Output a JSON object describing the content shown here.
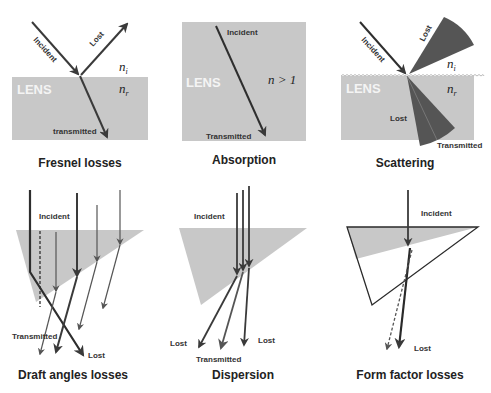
{
  "colors": {
    "lens_fill": "#c8c8c8",
    "ray": "#3a3a3a",
    "cone": "#555555",
    "background": "#ffffff"
  },
  "panels": [
    {
      "id": "fresnel",
      "caption": "Fresnel losses",
      "lens_label": "LENS",
      "labels": {
        "incident": "Incident",
        "lost": "Lost",
        "transmitted": "transmitted",
        "n_i": "n",
        "n_i_sub": "i",
        "n_r": "n",
        "n_r_sub": "r"
      }
    },
    {
      "id": "absorption",
      "caption": "Absorption",
      "lens_label": "LENS",
      "labels": {
        "incident": "Incident",
        "transmitted": "Transmitted",
        "n_gt_1": "n > 1"
      }
    },
    {
      "id": "scattering",
      "caption": "Scattering",
      "lens_label": "LENS",
      "labels": {
        "incident": "Incident",
        "lost_top": "Lost",
        "lost_bottom": "Lost",
        "transmitted": "Transmitted",
        "n_i": "n",
        "n_i_sub": "i",
        "n_r": "n",
        "n_r_sub": "r"
      }
    },
    {
      "id": "draft",
      "caption": "Draft angles losses",
      "labels": {
        "incident": "Incident",
        "transmitted": "Transmitted",
        "lost": "Lost"
      }
    },
    {
      "id": "dispersion",
      "caption": "Dispersion",
      "labels": {
        "incident": "Incident",
        "lost_left": "Lost",
        "lost_right": "Lost",
        "transmitted": "Transmitted"
      }
    },
    {
      "id": "formfactor",
      "caption": "Form factor losses",
      "labels": {
        "incident": "Incident",
        "lost": "Lost"
      }
    }
  ]
}
